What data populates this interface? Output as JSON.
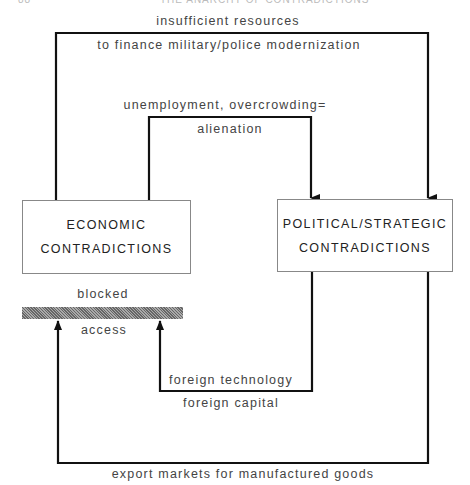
{
  "page_header": {
    "page_number": "88",
    "running_title": "THE ANARCHY OF CONTRADICTIONS"
  },
  "nodes": {
    "economic": {
      "line1": "ECONOMIC",
      "line2": "CONTRADICTIONS"
    },
    "political": {
      "line1": "POLITICAL/STRATEGIC",
      "line2": "CONTRADICTIONS"
    }
  },
  "edges": {
    "outer_top": {
      "label_above": "insufficient resources",
      "label_below": "to finance military/police modernization",
      "from": "economic",
      "to": "political"
    },
    "inner_top": {
      "label_above": "unemployment, overcrowding=",
      "label_below": "alienation",
      "from": "economic",
      "to": "political"
    },
    "inner_bottom": {
      "label_above": "foreign technology",
      "label_below": "foreign capital",
      "from": "political",
      "to": "economic"
    },
    "outer_bottom": {
      "label_below": "export markets for manufactured goods",
      "from": "political",
      "to": "economic"
    }
  },
  "barrier": {
    "label_above": "blocked",
    "label_below": "access"
  }
}
